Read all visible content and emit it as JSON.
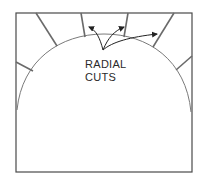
{
  "diagram": {
    "label_line1": "RADIAL",
    "label_line2": "CUTS",
    "colors": {
      "stroke": "#4a4a4a",
      "cut_stroke": "#6a6a6a",
      "arc_stroke": "#7a7a7a",
      "text": "#2a2a2a",
      "background": "#ffffff"
    }
  }
}
